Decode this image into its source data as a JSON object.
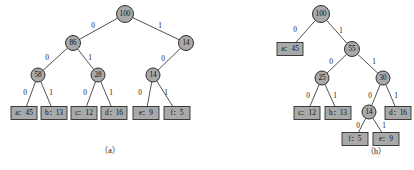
{
  "figure": {
    "caption_a": "（a）",
    "caption_b": "（b）",
    "caption_a_pos": {
      "x": 110,
      "y": 151
    },
    "caption_b_pos": {
      "x": 376,
      "y": 152
    }
  },
  "chart_data": {
    "type": "diagram",
    "subtitle": "Two binary code trees with weighted internal nodes and labeled 0/1 edges",
    "diagrams": [
      {
        "id": "a",
        "caption": "（a）",
        "nodes": [
          {
            "id": "a_root",
            "label": "100",
            "shape": "circle",
            "x": 125,
            "y": 14,
            "r": 8.5
          },
          {
            "id": "a_86",
            "label": "86",
            "shape": "circle",
            "x": 73,
            "y": 43,
            "r": 7.5
          },
          {
            "id": "a_14r",
            "label": "14",
            "shape": "circle",
            "x": 186,
            "y": 43,
            "r": 7.5
          },
          {
            "id": "a_58",
            "label": "58",
            "shape": "circle",
            "x": 38,
            "y": 75,
            "r": 7
          },
          {
            "id": "a_28",
            "label": "28",
            "shape": "circle",
            "x": 98,
            "y": 75,
            "r": 7
          },
          {
            "id": "a_14",
            "label": "14",
            "shape": "circle",
            "x": 153,
            "y": 75,
            "r": 7
          },
          {
            "id": "a_leaf_a",
            "label": "a：45",
            "shape": "box",
            "x": 24,
            "y": 113,
            "w": 26,
            "h": 13
          },
          {
            "id": "a_leaf_b",
            "label": "b：13",
            "shape": "box",
            "x": 54,
            "y": 113,
            "w": 26,
            "h": 13
          },
          {
            "id": "a_leaf_c",
            "label": "c：12",
            "shape": "box",
            "x": 84,
            "y": 113,
            "w": 26,
            "h": 13
          },
          {
            "id": "a_leaf_d",
            "label": "d：16",
            "shape": "box",
            "x": 114,
            "y": 113,
            "w": 26,
            "h": 13
          },
          {
            "id": "a_leaf_e",
            "label": "e：9",
            "shape": "box",
            "x": 146,
            "y": 113,
            "w": 26,
            "h": 13
          },
          {
            "id": "a_leaf_f",
            "label": "f：5",
            "shape": "box",
            "x": 177,
            "y": 113,
            "w": 26,
            "h": 13
          }
        ],
        "edges": [
          {
            "from": "a_root",
            "to": "a_86",
            "label": "0",
            "lx": 93,
            "ly": 26
          },
          {
            "from": "a_root",
            "to": "a_14r",
            "label": "1",
            "lx": 160,
            "ly": 26
          },
          {
            "from": "a_86",
            "to": "a_58",
            "label": "0",
            "lx": 47,
            "ly": 58
          },
          {
            "from": "a_86",
            "to": "a_28",
            "label": "1",
            "lx": 90,
            "ly": 58
          },
          {
            "from": "a_14r",
            "to": "a_14",
            "label": "0",
            "lx": 163,
            "ly": 59
          },
          {
            "from": "a_58",
            "to": "a_leaf_a",
            "label": "0",
            "lx": 25,
            "ly": 93
          },
          {
            "from": "a_58",
            "to": "a_leaf_b",
            "label": "1",
            "lx": 51,
            "ly": 93
          },
          {
            "from": "a_28",
            "to": "a_leaf_c",
            "label": "0",
            "lx": 85,
            "ly": 93
          },
          {
            "from": "a_28",
            "to": "a_leaf_d",
            "label": "1",
            "lx": 111,
            "ly": 93
          },
          {
            "from": "a_14",
            "to": "a_leaf_e",
            "label": "0",
            "lx": 140,
            "ly": 93
          },
          {
            "from": "a_14",
            "to": "a_leaf_f",
            "label": "1",
            "lx": 166,
            "ly": 93
          }
        ]
      },
      {
        "id": "b",
        "caption": "（b）",
        "nodes": [
          {
            "id": "b_root",
            "label": "100",
            "shape": "circle",
            "x": 321,
            "y": 14,
            "r": 8.5
          },
          {
            "id": "b_leaf_a",
            "label": "a：45",
            "shape": "box",
            "x": 290,
            "y": 49,
            "w": 26,
            "h": 13
          },
          {
            "id": "b_55",
            "label": "55",
            "shape": "circle",
            "x": 352,
            "y": 49,
            "r": 7.5
          },
          {
            "id": "b_25",
            "label": "25",
            "shape": "circle",
            "x": 322,
            "y": 78,
            "r": 7
          },
          {
            "id": "b_30",
            "label": "30",
            "shape": "circle",
            "x": 383,
            "y": 78,
            "r": 7
          },
          {
            "id": "b_leaf_c",
            "label": "c：12",
            "shape": "box",
            "x": 307,
            "y": 113,
            "w": 26,
            "h": 13
          },
          {
            "id": "b_leaf_b",
            "label": "b：13",
            "shape": "box",
            "x": 338,
            "y": 113,
            "w": 26,
            "h": 13
          },
          {
            "id": "b_14",
            "label": "14",
            "shape": "circle",
            "x": 369,
            "y": 112,
            "r": 7
          },
          {
            "id": "b_leaf_d",
            "label": "d：16",
            "shape": "box",
            "x": 398,
            "y": 113,
            "w": 26,
            "h": 13
          },
          {
            "id": "b_leaf_f",
            "label": "f：5",
            "shape": "box",
            "x": 355,
            "y": 139,
            "w": 26,
            "h": 13
          },
          {
            "id": "b_leaf_e",
            "label": "e：9",
            "shape": "box",
            "x": 386,
            "y": 139,
            "w": 26,
            "h": 13
          }
        ],
        "edges": [
          {
            "from": "b_root",
            "to": "b_leaf_a",
            "label": "0",
            "lx": 295,
            "ly": 30
          },
          {
            "from": "b_root",
            "to": "b_55",
            "label": "1",
            "lx": 341,
            "ly": 31
          },
          {
            "from": "b_55",
            "to": "b_25",
            "label": "0",
            "lx": 331,
            "ly": 62
          },
          {
            "from": "b_55",
            "to": "b_30",
            "label": "1",
            "lx": 374,
            "ly": 62
          },
          {
            "from": "b_25",
            "to": "b_leaf_c",
            "label": "0",
            "lx": 308,
            "ly": 96
          },
          {
            "from": "b_25",
            "to": "b_leaf_b",
            "label": "1",
            "lx": 335,
            "ly": 96
          },
          {
            "from": "b_30",
            "to": "b_14",
            "label": "0",
            "lx": 370,
            "ly": 96
          },
          {
            "from": "b_30",
            "to": "b_leaf_d",
            "label": "1",
            "lx": 396,
            "ly": 96
          },
          {
            "from": "b_14",
            "to": "b_leaf_f",
            "label": "0",
            "lx": 358,
            "ly": 126
          },
          {
            "from": "b_14",
            "to": "b_leaf_e",
            "label": "1",
            "lx": 384,
            "ly": 126
          }
        ]
      }
    ]
  }
}
